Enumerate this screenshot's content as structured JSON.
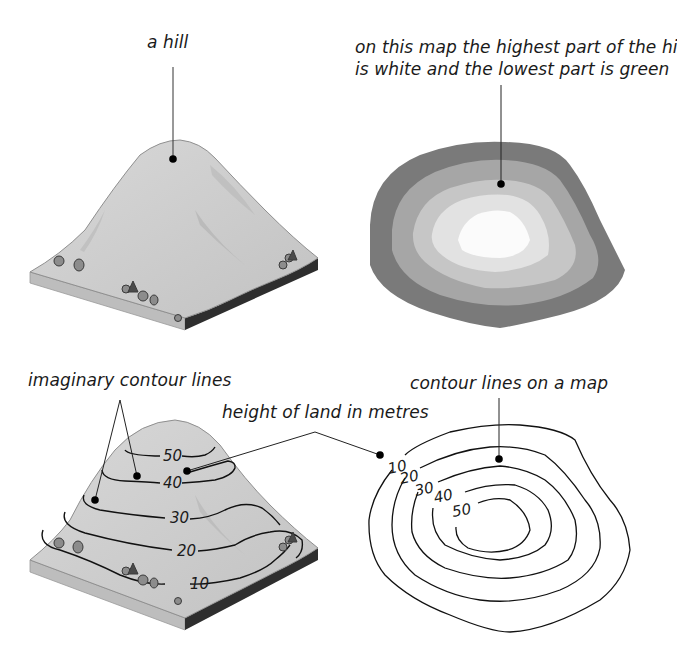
{
  "panels": {
    "hill": {
      "label": "a hill"
    },
    "layered_map": {
      "label_line1": "on this map the highest part of the hill",
      "label_line2": "is white and the lowest part is green",
      "band_colors": [
        "#7a7a7a",
        "#a6a6a6",
        "#c6c6c6",
        "#e2e2e2",
        "#fbfbfb"
      ]
    },
    "hill_with_contours": {
      "label_contours": "imaginary contour lines",
      "label_height": "height of land in metres",
      "contour_values": [
        "50",
        "40",
        "30",
        "20",
        "10"
      ]
    },
    "contour_map": {
      "label": "contour lines on a map",
      "contour_values": [
        "10",
        "20",
        "30",
        "40",
        "50"
      ]
    }
  },
  "colors": {
    "ink": "#1a1a1a",
    "hill_surface": "#cfcfcf",
    "hill_side_light": "#bdbdbd",
    "hill_side_dark": "#2e2e2e"
  }
}
